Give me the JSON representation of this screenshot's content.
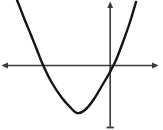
{
  "figure": {
    "background_color": "#ffffff",
    "width": 163,
    "height": 130
  },
  "chart_data": {
    "type": "line",
    "title": "",
    "subtitle": "",
    "xlabel": "",
    "ylabel": "",
    "grid": false,
    "legend": null,
    "annotations": [],
    "tick_labels": {
      "x": [],
      "y": []
    },
    "axes": {
      "x_axis": {
        "name": "x-axis",
        "color": "#3a3a3a",
        "pixel_y": 65,
        "pixel_x_start": 2,
        "pixel_x_end": 158,
        "arrow_start": true,
        "arrow_end": true
      },
      "y_axis": {
        "name": "y-axis",
        "color": "#3a3a3a",
        "pixel_x": 110,
        "pixel_y_start": 2,
        "pixel_y_end": 128,
        "arrow_start": true,
        "arrow_end": false
      },
      "origin_pixel": [
        110,
        65
      ]
    },
    "curve": {
      "name": "upward-parabola",
      "color": "#141414",
      "stroke_width": 2.4,
      "equation": "y = a(x - h)^2 + k, opens upward",
      "vertex_pixel": [
        77,
        113
      ],
      "x_intercepts_pixel": [
        37,
        116
      ],
      "y_intercept_pixel": [
        110,
        72
      ],
      "opens": "up",
      "xlim_pixel": [
        17,
        137
      ],
      "ylim_pixel": [
        0,
        113
      ],
      "path": "M 17 0 Q 30 35 43.5 61 Q 60 94.5 77 112.8 Q 94.5 94.5 111 66.5 Q 124.5 35 136.5 0"
    },
    "series": [
      {
        "name": "parabola",
        "points_pixel": [
          [
            17,
            0
          ],
          [
            24,
            18
          ],
          [
            31,
            35
          ],
          [
            37,
            50
          ],
          [
            43,
            65
          ],
          [
            52,
            83
          ],
          [
            62,
            98
          ],
          [
            70,
            107
          ],
          [
            77,
            113
          ],
          [
            85,
            110
          ],
          [
            94,
            99
          ],
          [
            103,
            84
          ],
          [
            110,
            72
          ],
          [
            116,
            60
          ],
          [
            123,
            42
          ],
          [
            130,
            22
          ],
          [
            136,
            2
          ]
        ]
      }
    ]
  }
}
